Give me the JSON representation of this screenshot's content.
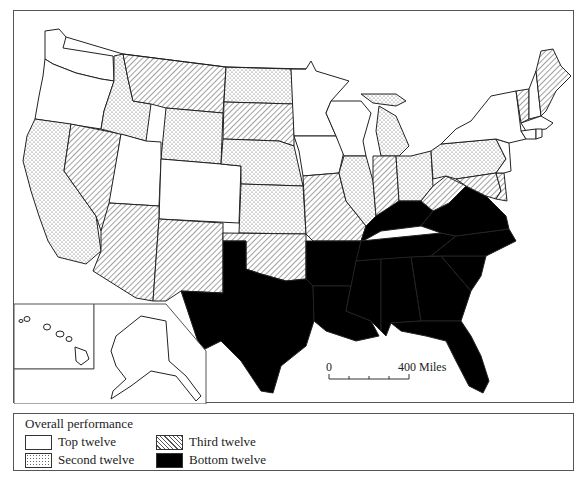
{
  "map": {
    "title": "Overall performance of U.S. states (ranked in groups of twelve)",
    "scale_bar": {
      "start_label": "0",
      "end_label": "400 Miles"
    },
    "categories": {
      "top": {
        "label": "Top twelve",
        "fill": "white"
      },
      "second": {
        "label": "Second twelve",
        "fill": "dotted"
      },
      "third": {
        "label": "Third twelve",
        "fill": "hatched"
      },
      "bottom": {
        "label": "Bottom twelve",
        "fill": "black"
      }
    },
    "states": {
      "Washington": "top",
      "Oregon": "top",
      "Utah": "top",
      "Colorado": "top",
      "Minnesota": "top",
      "Wisconsin": "top",
      "Iowa": "top",
      "New York": "top",
      "New Hampshire": "top",
      "Massachusetts": "top",
      "Connecticut": "top",
      "Rhode Island": "top",
      "New Jersey": "top",
      "Alaska": "top",
      "Hawaii": "top",
      "California": "second",
      "Idaho": "second",
      "Wyoming": "second",
      "North Dakota": "second",
      "Nebraska": "second",
      "Kansas": "second",
      "Illinois": "second",
      "Michigan": "second",
      "Ohio": "second",
      "Pennsylvania": "second",
      "Nevada": "third",
      "Montana": "third",
      "Arizona": "third",
      "New Mexico": "third",
      "South Dakota": "third",
      "Oklahoma": "third",
      "Missouri": "third",
      "Indiana": "third",
      "West Virginia": "third",
      "Maryland": "third",
      "Delaware": "third",
      "Vermont": "third",
      "Maine": "third",
      "Texas": "bottom",
      "Arkansas": "bottom",
      "Louisiana": "bottom",
      "Mississippi": "bottom",
      "Alabama": "bottom",
      "Tennessee": "bottom",
      "Kentucky": "bottom",
      "Georgia": "bottom",
      "Florida": "bottom",
      "South Carolina": "bottom",
      "North Carolina": "bottom",
      "Virginia": "bottom"
    }
  },
  "legend": {
    "title": "Overall performance",
    "items": [
      {
        "key": "top",
        "label": "Top twelve"
      },
      {
        "key": "third",
        "label": "Third twelve"
      },
      {
        "key": "second",
        "label": "Second twelve"
      },
      {
        "key": "bottom",
        "label": "Bottom twelve"
      }
    ]
  },
  "colors": {
    "line": "#222222",
    "fill_bottom": "#000000",
    "frame": "#555555"
  }
}
